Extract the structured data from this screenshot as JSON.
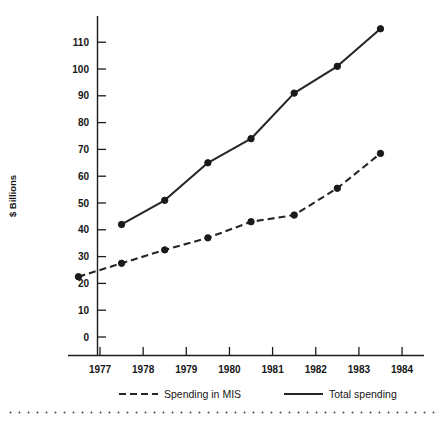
{
  "chart_data": {
    "type": "line",
    "title": "",
    "xlabel": "",
    "ylabel": "$ Billions",
    "xlim": [
      1976.0,
      1984.0
    ],
    "ylim": [
      0,
      118
    ],
    "grid": false,
    "legend_position": "bottom",
    "xticks": [
      "1977",
      "1978",
      "1979",
      "1980",
      "1981",
      "1982",
      "1983",
      "1984"
    ],
    "yticks": [
      "0",
      "10",
      "20",
      "30",
      "40",
      "50",
      "60",
      "70",
      "80",
      "90",
      "100",
      "110"
    ],
    "series": [
      {
        "name": "Spending in MIS",
        "style": "dashed",
        "x": [
          1976.5,
          1977.5,
          1978.5,
          1979.5,
          1980.5,
          1981.5,
          1982.5,
          1983.5
        ],
        "values": [
          22.5,
          27.5,
          32.5,
          37.0,
          43.0,
          45.5,
          55.5,
          68.5
        ]
      },
      {
        "name": "Total spending",
        "style": "solid",
        "x": [
          1977.5,
          1978.5,
          1979.5,
          1980.5,
          1981.5,
          1982.5,
          1983.5
        ],
        "values": [
          42.0,
          51.0,
          65.0,
          74.0,
          91.0,
          101.0,
          115.0
        ]
      }
    ]
  },
  "legend": {
    "items": [
      {
        "label": "Spending in MIS",
        "style": "dashed"
      },
      {
        "label": "Total spending",
        "style": "solid"
      }
    ]
  },
  "axis": {
    "y_title": "$ Billions"
  },
  "colors": {
    "ink": "#262626",
    "background": "#ffffff"
  }
}
